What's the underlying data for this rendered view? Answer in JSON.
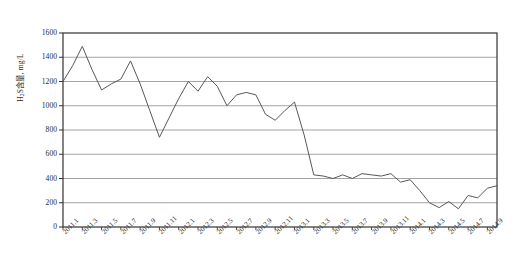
{
  "chart_data": {
    "type": "line",
    "title": "",
    "subtitle": "",
    "xlabel": "",
    "ylabel": "H2S含量, mg/L",
    "ylabel_parts": {
      "prefix": "H",
      "sub": "2",
      "suffix": "S含量, mg/L"
    },
    "ylim": [
      0,
      1600
    ],
    "ytick_step": 200,
    "yticks": [
      "0",
      "200",
      "400",
      "600",
      "800",
      "1000",
      "1200",
      "1400",
      "1600"
    ],
    "grid": true,
    "grid_axis": "y",
    "legend": "none",
    "markers": "none",
    "line_color": "#585858",
    "grid_color": "#9a9a9a",
    "frame_color": "#333333",
    "axis_tick_interval_months": 2,
    "xtick_labels": [
      "2011.1",
      "2011.3",
      "2011.5",
      "2011.7",
      "2011.9",
      "2011.11",
      "2012.1",
      "2012.3",
      "2012.5",
      "2012.7",
      "2012.9",
      "2012.11",
      "2013.1",
      "2013.3",
      "2013.5",
      "2013.7",
      "2013.9",
      "2013.11",
      "2014.1",
      "2014.3",
      "2014.5",
      "2014.7",
      "2014.9"
    ],
    "x": [
      "2011.1",
      "2011.2",
      "2011.3",
      "2011.4",
      "2011.5",
      "2011.6",
      "2011.7",
      "2011.8",
      "2011.9",
      "2011.10",
      "2011.11",
      "2011.12",
      "2012.1",
      "2012.2",
      "2012.3",
      "2012.4",
      "2012.5",
      "2012.6",
      "2012.7",
      "2012.8",
      "2012.9",
      "2012.10",
      "2012.11",
      "2012.12",
      "2013.1",
      "2013.2",
      "2013.3",
      "2013.4",
      "2013.5",
      "2013.6",
      "2013.7",
      "2013.8",
      "2013.9",
      "2013.10",
      "2013.11",
      "2013.12",
      "2014.1",
      "2014.2",
      "2014.3",
      "2014.4",
      "2014.5",
      "2014.6",
      "2014.7",
      "2014.8",
      "2014.9",
      "2014.10"
    ],
    "values": [
      1200,
      1330,
      1490,
      1300,
      1130,
      1180,
      1220,
      1370,
      1180,
      960,
      740,
      900,
      1060,
      1200,
      1120,
      1240,
      1160,
      1000,
      1090,
      1110,
      1090,
      930,
      880,
      960,
      1030,
      760,
      430,
      420,
      400,
      430,
      400,
      440,
      430,
      420,
      440,
      370,
      390,
      300,
      200,
      160,
      210,
      150,
      260,
      240,
      320,
      340
    ],
    "series_name": "H2S含量"
  }
}
